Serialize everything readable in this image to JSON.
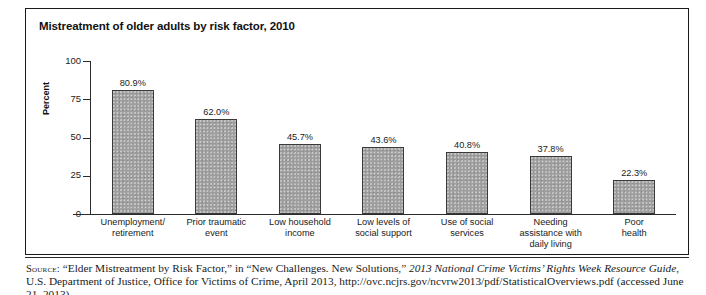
{
  "figure": {
    "title": "Mistreatment of older adults by risk factor, 2010"
  },
  "chart_data": {
    "type": "bar",
    "title": "Mistreatment of older adults by risk factor, 2010",
    "xlabel": "",
    "ylabel": "Percent",
    "ylim": [
      0,
      100
    ],
    "yticks": [
      "0",
      "25",
      "50",
      "75",
      "100"
    ],
    "grid": false,
    "legend": null,
    "categories": [
      "Unemployment/ retirement",
      "Prior traumatic event",
      "Low household income",
      "Low levels of social support",
      "Use of social services",
      "Needing assistance with daily living",
      "Poor health"
    ],
    "category_lines": [
      [
        "Unemployment/",
        "retirement"
      ],
      [
        "Prior traumatic",
        "event"
      ],
      [
        "Low household",
        "income"
      ],
      [
        "Low levels of",
        "social support"
      ],
      [
        "Use of social",
        "services"
      ],
      [
        "Needing",
        "assistance with",
        "daily living"
      ],
      [
        "Poor",
        "health"
      ]
    ],
    "values": [
      80.9,
      62.0,
      45.7,
      43.6,
      40.8,
      37.8,
      22.3
    ],
    "data_labels": [
      "80.9%",
      "62.0%",
      "45.7%",
      "43.6%",
      "40.8%",
      "37.8%",
      "22.3%"
    ],
    "bar_color": "#9d9d9d",
    "bar_edge_color": "#3a3a3a"
  },
  "source": {
    "kicker": "Source:",
    "text_part1": " “Elder Mistreatment by Risk Factor,” in “New Challenges. New Solutions,” ",
    "text_italic": "2013 National Crime Victims’ Rights Week Resource Guide",
    "text_part2": ", U.S. Department of Justice, Office for Victims of Crime, April 2013, http://ovc.ncjrs.gov/ncvrw2013/pdf/StatisticalOverviews.pdf (accessed June 21, 2013)"
  }
}
